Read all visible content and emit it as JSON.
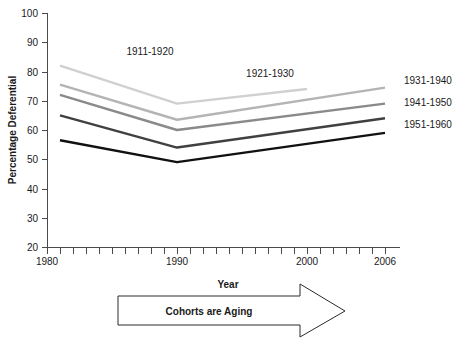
{
  "chart_data": {
    "type": "line",
    "title": "",
    "xlabel": "Year",
    "ylabel": "Percentage Deferential",
    "xlim": [
      1980,
      2006
    ],
    "ylim": [
      20,
      100
    ],
    "grid": false,
    "legend_position": "right",
    "x_tick_labels": [
      "1980",
      "1990",
      "2000",
      "2006"
    ],
    "x_tick_values": [
      1980,
      1990,
      2000,
      2006
    ],
    "x_minor_tick_step": 1,
    "y_tick_labels": [
      "20",
      "30",
      "40",
      "50",
      "60",
      "70",
      "80",
      "90",
      "100"
    ],
    "y_tick_values": [
      20,
      30,
      40,
      50,
      60,
      70,
      80,
      90,
      100
    ],
    "series": [
      {
        "name": "1911-1920",
        "color": "#d0d0d0",
        "label_position": "inline",
        "x": [
          1981,
          1990,
          2000
        ],
        "values": [
          82,
          69,
          74
        ]
      },
      {
        "name": "1921-1930",
        "color": "#b4b4b4",
        "label_position": "inline",
        "x": [
          1981,
          1990,
          2006
        ],
        "values": [
          75.5,
          63.5,
          74.5
        ]
      },
      {
        "name": "1931-1940",
        "color": "#8a8a8a",
        "label_position": "right",
        "x": [
          1981,
          1990,
          2006
        ],
        "values": [
          72,
          60,
          69
        ]
      },
      {
        "name": "1941-1950",
        "color": "#404040",
        "label_position": "right",
        "x": [
          1981,
          1990,
          2006
        ],
        "values": [
          65,
          54,
          64
        ]
      },
      {
        "name": "1951-1960",
        "color": "#111111",
        "label_position": "right",
        "x": [
          1981,
          1990,
          2006
        ],
        "values": [
          56.5,
          49,
          59
        ]
      }
    ],
    "inline_annotations": [
      {
        "text": "1911-1920",
        "x": 1990,
        "y": 88
      },
      {
        "text": "1921-1930",
        "x": 2000,
        "y": 80
      }
    ],
    "legend_entries": [
      {
        "text": "1931-1940"
      },
      {
        "text": "1941-1950"
      },
      {
        "text": "1951-1960"
      }
    ],
    "annotations": [
      {
        "text": "Cohorts are Aging",
        "shape": "right-arrow-banner"
      }
    ]
  },
  "axis": {
    "y_title": "Percentage Deferential",
    "x_title": "Year"
  },
  "arrow_banner": {
    "label": "Cohorts are Aging"
  }
}
